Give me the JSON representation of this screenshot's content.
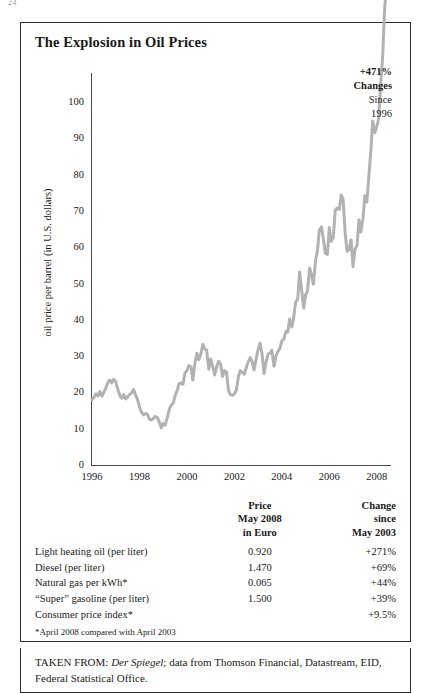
{
  "page_number": "24",
  "figure": {
    "title": "The Explosion in Oil Prices",
    "callout": {
      "percent": "+471%",
      "word": "Changes",
      "since_word": "Since",
      "since_year": "1996"
    }
  },
  "table": {
    "headers": {
      "label": "",
      "price_line1": "Price",
      "price_line2": "May 2008",
      "price_line3": "in Euro",
      "change_line1": "Change",
      "change_line2": "since",
      "change_line3": "May 2003"
    },
    "rows": [
      {
        "label": "Light heating oil (per liter)",
        "price": "0.920",
        "change": "+271%"
      },
      {
        "label": "Diesel (per liter)",
        "price": "1.470",
        "change": "+69%"
      },
      {
        "label": "Natural gas per kWh*",
        "price": "0.065",
        "change": "+44%"
      },
      {
        "label": "“Super” gasoline (per liter)",
        "price": "1.500",
        "change": "+39%"
      },
      {
        "label": "Consumer price index*",
        "price": "",
        "change": "+9.5%"
      }
    ],
    "footnote": "*April 2008 compared with April 2003"
  },
  "source": {
    "prefix": "TAKEN FROM: ",
    "publication": "Der Spiegel",
    "rest": "; data from Thomson Financial, Datastream, EID, Federal Statistical Office."
  },
  "chart_data": {
    "type": "line",
    "title": "The Explosion in Oil Prices",
    "xlabel": "",
    "ylabel": "oil price per barrel (in U.S. dollars)",
    "xlim": [
      1996,
      2008.6
    ],
    "ylim": [
      0,
      108
    ],
    "grid": false,
    "legend": null,
    "line_color": "#b2b2b2",
    "line_width": 3,
    "y_ticks": [
      0,
      10,
      20,
      30,
      40,
      50,
      60,
      70,
      80,
      90,
      100
    ],
    "x_ticks": [
      1996,
      1998,
      2000,
      2002,
      2004,
      2006,
      2008
    ],
    "annotations": [
      {
        "text": "+471% Changes Since 1996",
        "x": 2008.2,
        "y": 103
      }
    ],
    "series": [
      {
        "name": "oil price per barrel (U.S. dollars)",
        "x": [
          1996.0,
          1996.08,
          1996.17,
          1996.25,
          1996.33,
          1996.42,
          1996.5,
          1996.58,
          1996.67,
          1996.75,
          1996.83,
          1996.92,
          1997.0,
          1997.08,
          1997.17,
          1997.25,
          1997.33,
          1997.42,
          1997.5,
          1997.58,
          1997.67,
          1997.75,
          1997.83,
          1997.92,
          1998.0,
          1998.08,
          1998.17,
          1998.25,
          1998.33,
          1998.42,
          1998.5,
          1998.58,
          1998.67,
          1998.75,
          1998.83,
          1998.92,
          1999.0,
          1999.08,
          1999.17,
          1999.25,
          1999.33,
          1999.42,
          1999.5,
          1999.58,
          1999.67,
          1999.75,
          1999.83,
          1999.92,
          2000.0,
          2000.08,
          2000.17,
          2000.25,
          2000.33,
          2000.42,
          2000.5,
          2000.58,
          2000.67,
          2000.75,
          2000.83,
          2000.92,
          2001.0,
          2001.08,
          2001.17,
          2001.25,
          2001.33,
          2001.42,
          2001.5,
          2001.58,
          2001.67,
          2001.75,
          2001.83,
          2001.92,
          2002.0,
          2002.08,
          2002.17,
          2002.25,
          2002.33,
          2002.42,
          2002.5,
          2002.58,
          2002.67,
          2002.75,
          2002.83,
          2002.92,
          2003.0,
          2003.08,
          2003.17,
          2003.25,
          2003.33,
          2003.42,
          2003.5,
          2003.58,
          2003.67,
          2003.75,
          2003.83,
          2003.92,
          2004.0,
          2004.08,
          2004.17,
          2004.25,
          2004.33,
          2004.42,
          2004.5,
          2004.58,
          2004.67,
          2004.75,
          2004.83,
          2004.92,
          2005.0,
          2005.08,
          2005.17,
          2005.25,
          2005.33,
          2005.42,
          2005.5,
          2005.58,
          2005.67,
          2005.75,
          2005.83,
          2005.92,
          2006.0,
          2006.08,
          2006.17,
          2006.25,
          2006.33,
          2006.42,
          2006.5,
          2006.58,
          2006.67,
          2006.75,
          2006.83,
          2006.92,
          2007.0,
          2007.08,
          2007.17,
          2007.25,
          2007.33,
          2007.42,
          2007.5,
          2007.58,
          2007.67,
          2007.75,
          2007.83,
          2007.92,
          2008.0,
          2008.08,
          2008.17,
          2008.25,
          2008.33,
          2008.42
        ],
        "y": [
          18.0,
          18.6,
          19.6,
          19.0,
          20.2,
          19.0,
          20.0,
          21.2,
          22.8,
          23.4,
          22.6,
          23.6,
          23.0,
          21.0,
          19.2,
          18.4,
          19.4,
          18.2,
          18.8,
          19.4,
          19.8,
          20.8,
          19.4,
          18.0,
          16.0,
          14.6,
          13.8,
          14.2,
          14.0,
          12.6,
          12.4,
          12.8,
          13.4,
          13.0,
          12.0,
          10.2,
          11.4,
          11.0,
          13.0,
          15.2,
          16.4,
          17.0,
          19.0,
          20.4,
          22.4,
          22.6,
          22.2,
          25.4,
          26.0,
          27.4,
          27.0,
          23.4,
          27.8,
          30.8,
          29.0,
          30.4,
          33.2,
          32.0,
          31.6,
          26.4,
          29.2,
          27.4,
          24.8,
          27.0,
          28.6,
          27.8,
          24.4,
          26.0,
          25.6,
          20.6,
          19.4,
          19.2,
          19.6,
          20.6,
          24.4,
          26.0,
          25.6,
          25.0,
          26.8,
          28.4,
          29.6,
          28.4,
          26.2,
          29.4,
          31.8,
          33.6,
          30.4,
          25.2,
          28.2,
          30.6,
          30.8,
          31.6,
          27.2,
          30.0,
          31.2,
          32.2,
          34.2,
          34.6,
          36.8,
          36.6,
          40.2,
          38.0,
          40.6,
          44.8,
          45.8,
          53.2,
          48.4,
          43.2,
          46.8,
          48.0,
          54.2,
          52.4,
          49.8,
          56.4,
          59.0,
          64.8,
          65.6,
          62.4,
          58.4,
          58.0,
          65.4,
          61.6,
          62.8,
          70.2,
          70.8,
          70.4,
          74.4,
          73.2,
          63.8,
          58.8,
          59.4,
          62.0,
          54.6,
          59.4,
          60.6,
          67.6,
          64.2,
          68.0,
          74.2,
          72.4,
          79.8,
          86.4,
          94.8,
          91.6,
          93.2,
          95.4,
          105.6,
          112.6,
          125.4,
          133.0
        ]
      }
    ]
  }
}
